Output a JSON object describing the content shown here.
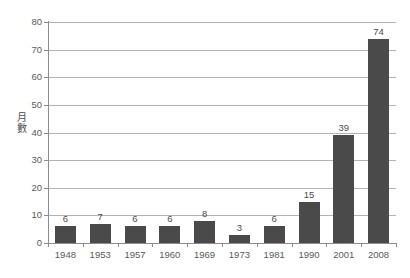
{
  "chart_data": {
    "type": "bar",
    "title": "",
    "subtitle": "",
    "xlabel": "",
    "ylabel": "月\n數",
    "ylabel_chars": [
      "月",
      "數"
    ],
    "categories": [
      "1948",
      "1953",
      "1957",
      "1960",
      "1969",
      "1973",
      "1981",
      "1990",
      "2001",
      "2008"
    ],
    "values": [
      6,
      7,
      6,
      6,
      8,
      3,
      6,
      15,
      39,
      74
    ],
    "value_labels": [
      "6",
      "7",
      "6",
      "6",
      "8",
      "3",
      "6",
      "15",
      "39",
      "74"
    ],
    "ylim": [
      0,
      80
    ],
    "y_ticks": [
      0,
      10,
      20,
      30,
      40,
      50,
      60,
      70,
      80
    ],
    "y_tick_labels": [
      "0",
      "10",
      "20",
      "30",
      "40",
      "50",
      "60",
      "70",
      "80"
    ],
    "grid": true,
    "grid_axis": "y",
    "legend": null,
    "legend_position": "none",
    "series": [
      {
        "name": "月數",
        "values": [
          6,
          7,
          6,
          6,
          8,
          3,
          6,
          15,
          39,
          74
        ]
      }
    ],
    "colors": {
      "bar": "#4a4a4a",
      "gridline": "#b4b4b4",
      "axis": "#8c8c8c",
      "text": "#4d4d4d",
      "background": "#ffffff"
    }
  }
}
